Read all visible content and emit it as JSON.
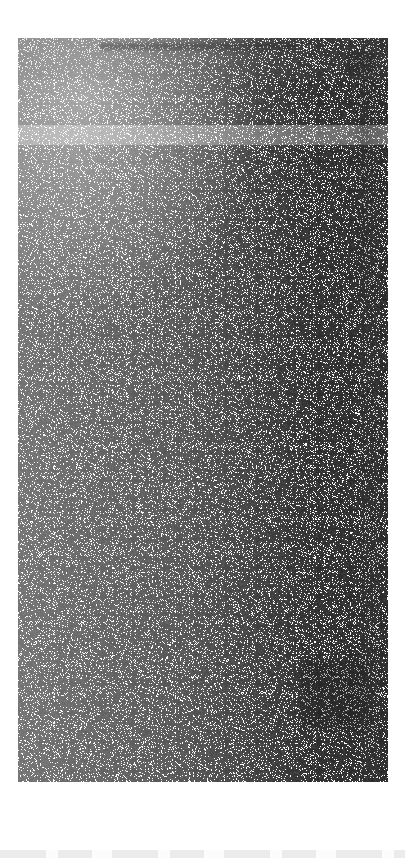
{
  "image": {
    "width": 405,
    "height": 858,
    "legible_text_present": false,
    "condition": "Severely degraded by dense salt-and-pepper noise; no text, icon glyph, or numeric value is recoverable at any zoom level."
  },
  "canvas": {
    "background_color": "#ffffff"
  },
  "content_panel": {
    "left": 18,
    "top": 38,
    "width": 370,
    "height": 744,
    "background_color": "#fdfdfd",
    "note": "Bounded on all four sides by clean white margin; the only firmly established boundary in the image."
  },
  "noise_field": {
    "character": "salt-and-pepper",
    "ink_color": "#1a1a1a",
    "paper_color": "#ffffff",
    "coverage": "fills the entire content panel",
    "density_gradient": "increases toward the right edge; lightest at upper-left"
  },
  "structural_regions": [
    {
      "name": "header-band",
      "top": 0,
      "height": 42,
      "evidence": "Dark horizontal streak at absolute y 42-48 spanning much of the panel width, consistent with a title text line.",
      "text": null
    },
    {
      "name": "header-title-streak",
      "left": 82,
      "top": 5,
      "width": 196,
      "height": 7,
      "evidence": "Continuous dark smear; a text run of indeterminate content.",
      "text": null
    },
    {
      "name": "header-icon-blob",
      "left": 327,
      "top": 14,
      "width": 30,
      "height": 22,
      "evidence": "Compact dark blob at absolute x 345-375, y 55-75, consistent with an icon or button at the header right.",
      "glyph": null
    },
    {
      "name": "row-separator-band",
      "top": 87,
      "height": 20,
      "evidence": "Faint lighter horizontal band at absolute y 125-145, suggesting separation between stacked rows.",
      "text": null
    },
    {
      "name": "highlight-block",
      "left": 282,
      "top": 622,
      "width": 70,
      "height": 70,
      "evidence": "Dense dark cluster at absolute x 300-370, y 660-730, consistent with a filled button or highlighted block.",
      "text": null
    },
    {
      "name": "scrollbar-track",
      "right": 8,
      "width": 20,
      "evidence": "Dark vertical band at absolute x 360-380 running the full panel height.",
      "text": null
    }
  ],
  "bottom_bar": {
    "top": 850,
    "height": 8,
    "evidence": "Faintest marks at the very bottom edge, below a clean white gap; only the topmost sliver of a bar is within frame.",
    "items": []
  }
}
